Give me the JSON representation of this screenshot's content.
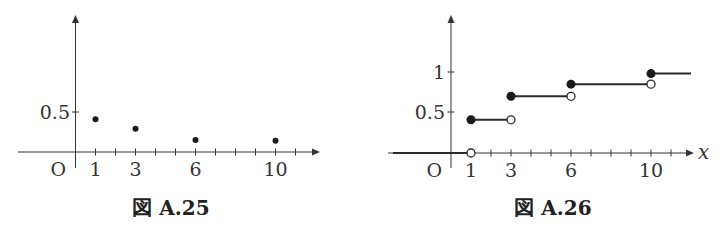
{
  "chart_data": [
    {
      "type": "scatter",
      "title": "図 A.25",
      "description": "Probability mass function (dots)",
      "x": [
        1,
        3,
        6,
        10
      ],
      "values": [
        0.41,
        0.29,
        0.15,
        0.14
      ],
      "xlabel": "",
      "ylabel": "",
      "origin_label": "O",
      "x_tick_labels": [
        "1",
        "3",
        "6",
        "10"
      ],
      "y_tick_labels": [
        "0.5"
      ],
      "y_ticks": [
        0.5
      ],
      "x_minor_ticks": [
        1,
        2,
        3,
        4,
        5,
        6,
        7,
        8,
        9,
        10,
        11
      ],
      "xlim": [
        -2.9,
        12.2
      ],
      "ylim": [
        0,
        1.7
      ],
      "grid": false
    },
    {
      "type": "line",
      "subtype": "step",
      "title": "図 A.26",
      "description": "Cumulative distribution function (step, filled = included, open = excluded)",
      "steps": [
        {
          "from": -2.9,
          "to": 1,
          "y": 0,
          "open_end": true
        },
        {
          "from": 1,
          "to": 3,
          "y": 0.41,
          "open_end": true
        },
        {
          "from": 3,
          "to": 6,
          "y": 0.7,
          "open_end": true
        },
        {
          "from": 6,
          "to": 10,
          "y": 0.85,
          "open_end": true
        },
        {
          "from": 10,
          "to": 12,
          "y": 0.98,
          "open_end": false
        }
      ],
      "xlabel": "x",
      "ylabel": "",
      "origin_label": "O",
      "x_tick_labels": [
        "1",
        "3",
        "6",
        "10"
      ],
      "y_tick_labels": [
        "0.5",
        "1"
      ],
      "y_ticks": [
        0.5,
        1
      ],
      "x_minor_ticks": [
        1,
        2,
        3,
        4,
        5,
        6,
        7,
        8,
        9,
        10,
        11
      ],
      "xlim": [
        -2.9,
        12.2
      ],
      "ylim": [
        0,
        1.7
      ],
      "grid": false
    }
  ],
  "figures": {
    "left": {
      "caption": "図 A.25",
      "origin": "O",
      "y_label_05": "0.5",
      "x_labels": [
        "1",
        "3",
        "6",
        "10"
      ]
    },
    "right": {
      "caption": "図 A.26",
      "origin": "O",
      "y_label_05": "0.5",
      "y_label_1": "1",
      "x_labels": [
        "1",
        "3",
        "6",
        "10"
      ],
      "x_var": "x"
    }
  }
}
